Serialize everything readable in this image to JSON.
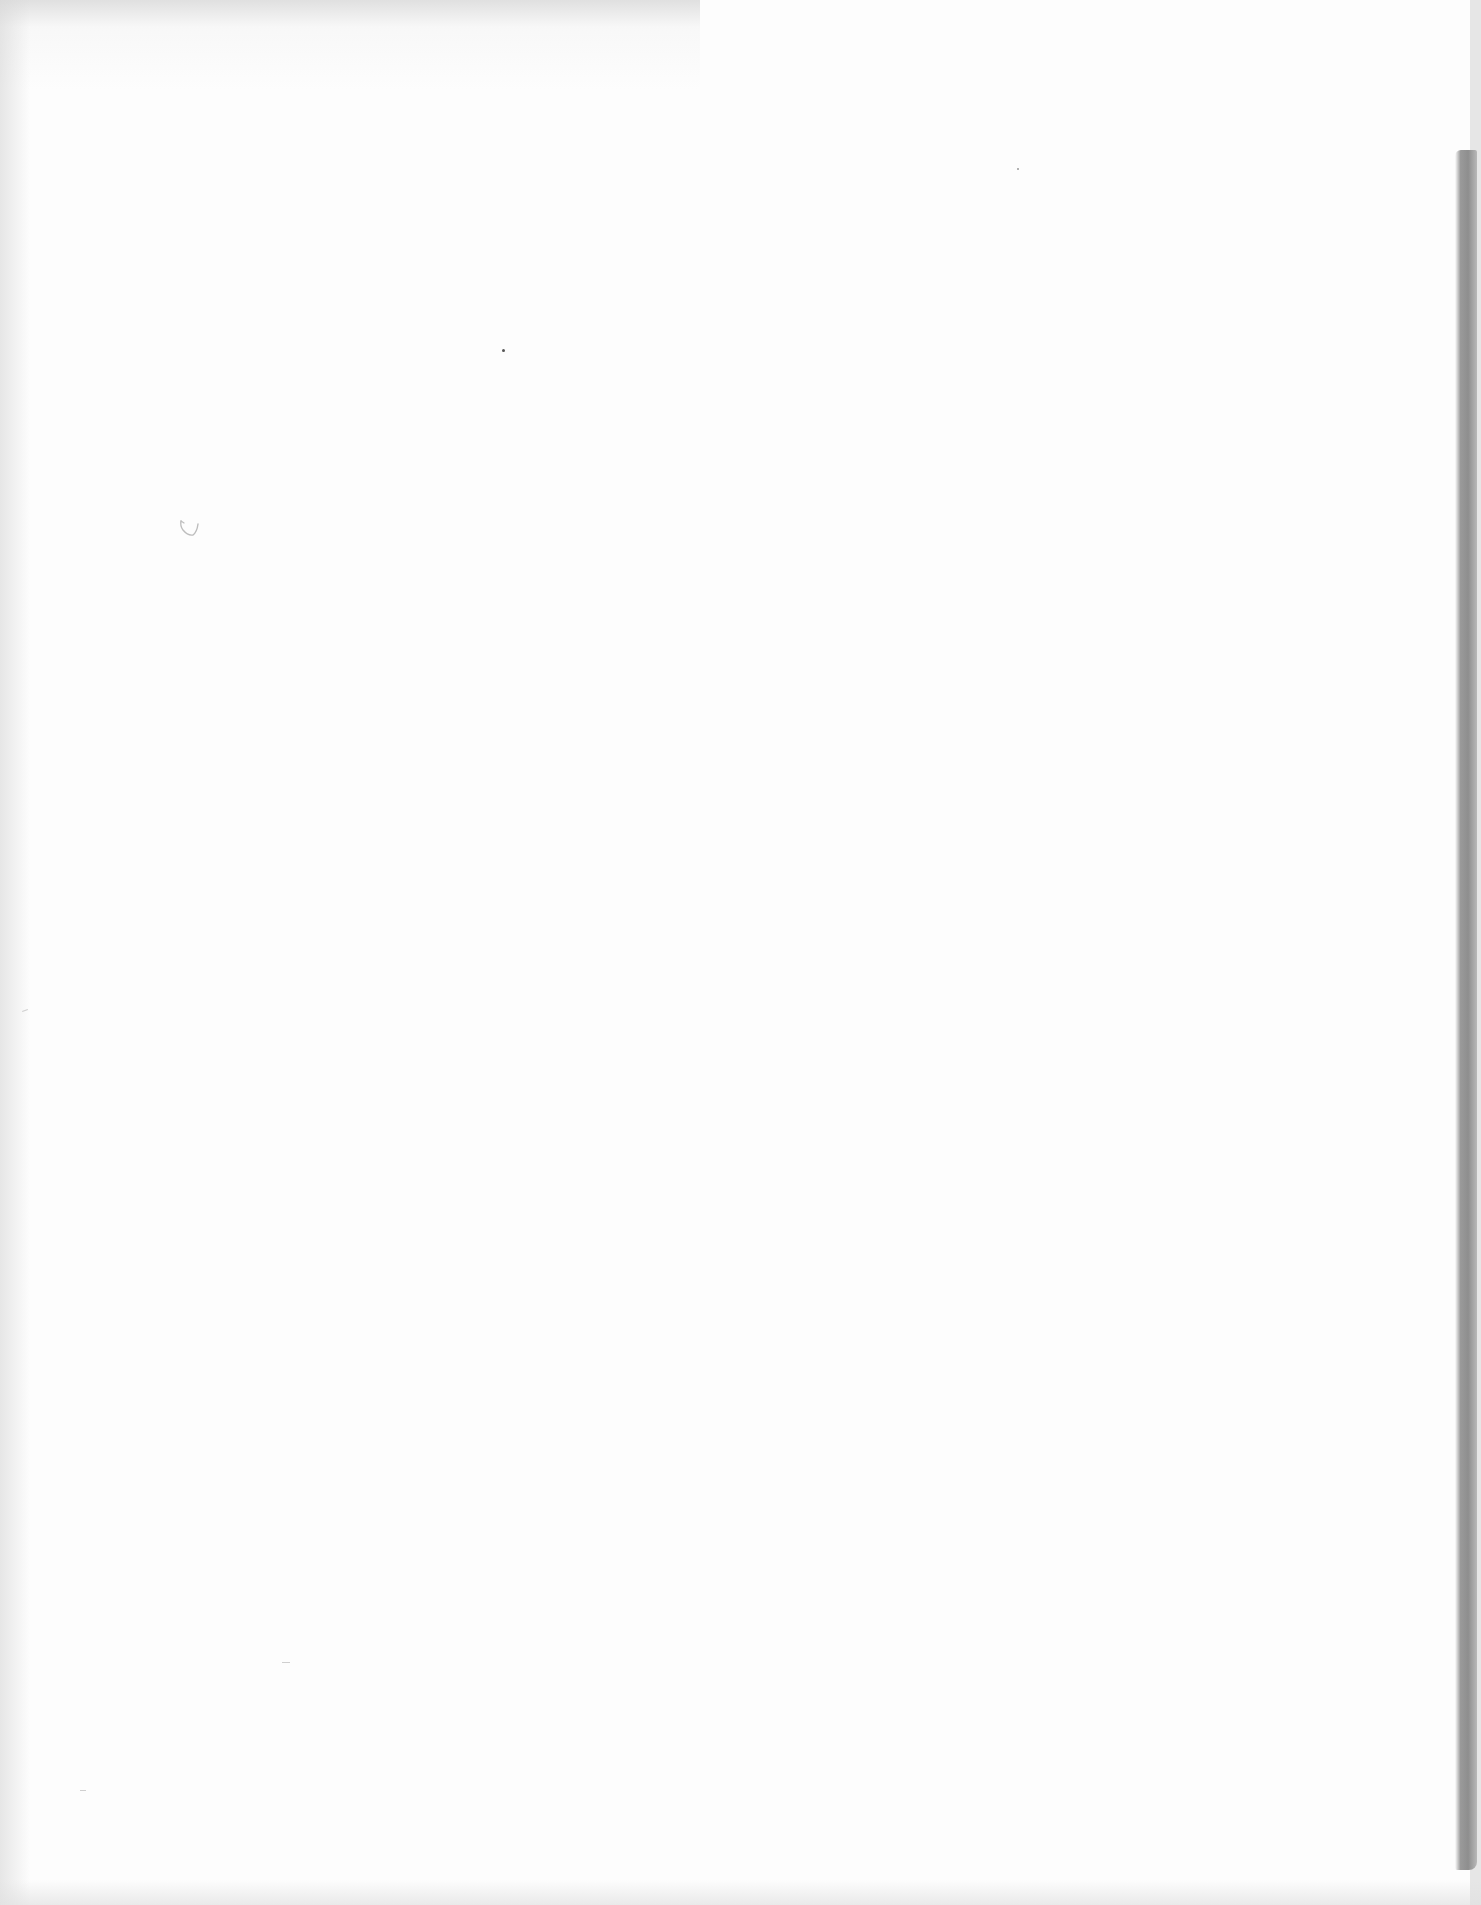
{
  "document": {
    "type": "blank scanned page",
    "text_content": []
  },
  "colors": {
    "paper": "#fdfdfd",
    "edge_shadow": "#8e8e8e",
    "pencil_mark": "#bdbdbd"
  }
}
